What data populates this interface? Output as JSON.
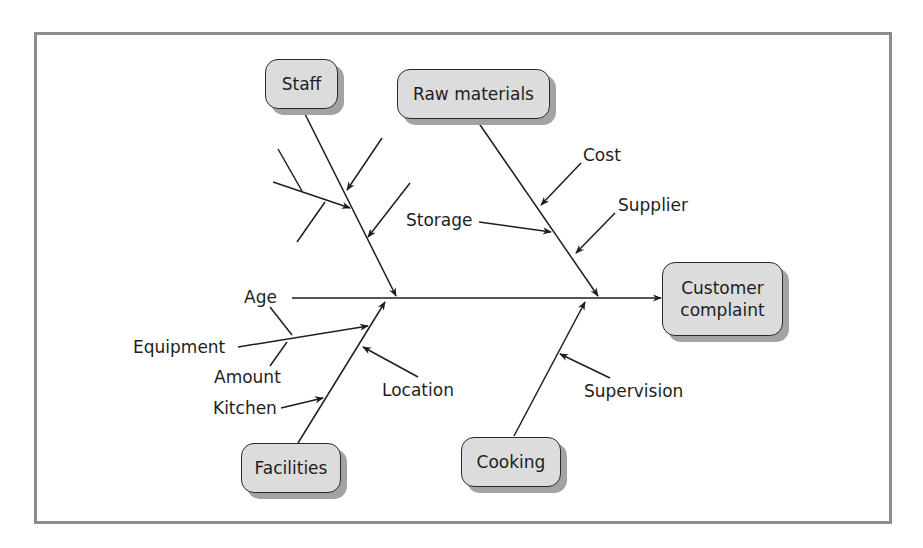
{
  "diagram": {
    "type": "fishbone",
    "effect": "Customer\ncomplaint",
    "categories": [
      {
        "id": "staff",
        "label": "Staff",
        "causes": [
          "",
          "",
          ""
        ]
      },
      {
        "id": "raw_materials",
        "label": "Raw materials",
        "causes": [
          "Cost",
          "Storage",
          "Supplier"
        ]
      },
      {
        "id": "facilities",
        "label": "Facilities",
        "causes": [
          "Equipment",
          "Location",
          "Kitchen"
        ],
        "sub_causes": {
          "Equipment": [
            "Age",
            "Amount"
          ]
        }
      },
      {
        "id": "cooking",
        "label": "Cooking",
        "causes": [
          "Supervision"
        ]
      }
    ]
  },
  "colors": {
    "box_fill": "#dcdcdc",
    "box_shadow": "#a3a3a3",
    "line": "#1e1e1e",
    "frame": "#8c8c8c"
  }
}
